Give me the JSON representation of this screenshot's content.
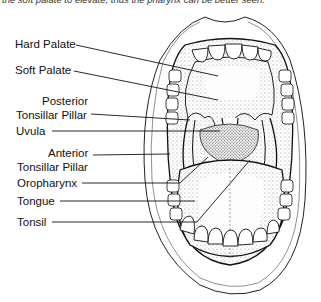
{
  "caption": "the soft palate to elevate, thus the pharynx can be better seen.",
  "labels": {
    "hard_palate": "Hard Palate",
    "soft_palate": "Soft Palate",
    "posterior_1": "Posterior",
    "posterior_2": "Tonsillar Pillar",
    "uvula": "Uvula",
    "anterior_1": "Anterior",
    "anterior_2": "Tonsillar Pillar",
    "oropharynx": "Oropharynx",
    "tongue": "Tongue",
    "tonsil": "Tonsil"
  }
}
